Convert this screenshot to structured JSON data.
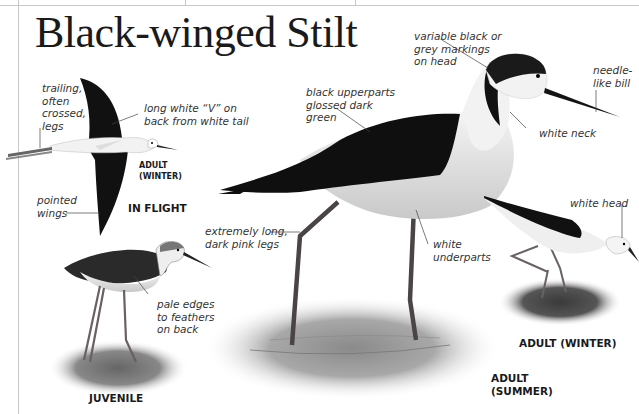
{
  "page": {
    "title": "Black-winged Stilt"
  },
  "figures": {
    "in_flight": {
      "caption": "IN FLIGHT",
      "sub_caption": "ADULT\n(WINTER)",
      "labels": {
        "legs": "trailing,\noften\ncrossed,\nlegs",
        "back_v": "long white “V” on\nback from white tail",
        "wings": "pointed\nwings"
      }
    },
    "juvenile": {
      "caption": "JUVENILE",
      "labels": {
        "feathers": "pale edges\nto feathers\non back"
      }
    },
    "adult_summer": {
      "caption": "ADULT\n(SUMMER)",
      "labels": {
        "head": "variable black or\ngrey markings\non head",
        "upperparts": "black upperparts\nglossed dark\ngreen",
        "bill": "needle-\nlike bill",
        "neck": "white neck",
        "legs": "extremely long,\ndark pink legs",
        "underparts": "white\nunderparts"
      }
    },
    "adult_winter": {
      "caption": "ADULT (WINTER)",
      "labels": {
        "head": "white head"
      }
    }
  },
  "colors": {
    "rule": "#c8c8c8",
    "text": "#1a1a1a",
    "plumage_black": "#111111",
    "leg": "#555050"
  }
}
